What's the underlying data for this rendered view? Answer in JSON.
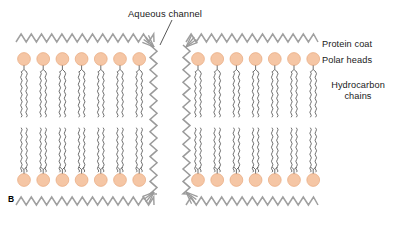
{
  "figure": {
    "panel_letter": "B",
    "title_label": "Aqueous channel"
  },
  "labels": {
    "protein_coat": "Protein coat",
    "polar_heads": "Polar heads",
    "hydrocarbon_line1": "Hydrocarbon",
    "hydrocarbon_line2": "chains"
  },
  "colors": {
    "polar_head_fill": "#f5c6a5",
    "polar_head_stroke": "#e8a97e",
    "protein_coat": "#a0a0a0",
    "channel_zigzag": "#9a9a9a",
    "hydrocarbon_chain": "#555555",
    "text": "#1a1a1a",
    "background": "#ffffff"
  },
  "structure": {
    "leaflets": 2,
    "heads_per_row_left": 7,
    "heads_per_row_right": 7,
    "chains_per_head": 2,
    "channel_count": 1,
    "protein_coat_bands": 2
  },
  "geometry": {
    "left_panel_start": 16,
    "left_panel_end": 150,
    "right_panel_start": 190,
    "right_panel_end": 318,
    "channel_left_x": 156,
    "channel_right_x": 184,
    "top_coat_y": 41,
    "top_heads_y": 59,
    "upper_chain_top": 68,
    "upper_chain_bottom": 117,
    "lower_chain_top": 128,
    "lower_chain_bottom": 176,
    "bottom_heads_y": 180,
    "bottom_coat_y": 198,
    "head_radius": 6.4,
    "head_spacing": 19.2,
    "leader_line_from": [
      172,
      20
    ],
    "leader_line_to": [
      160,
      45
    ]
  }
}
